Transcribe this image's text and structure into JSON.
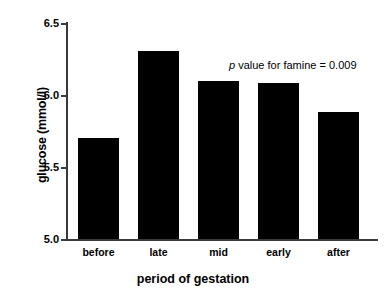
{
  "chart_data": {
    "type": "bar",
    "title": "",
    "xlabel": "period of gestation",
    "ylabel": "glucose (mmol/l)",
    "categories": [
      "before",
      "late",
      "mid",
      "early",
      "after"
    ],
    "values": [
      5.7,
      6.3,
      6.09,
      6.08,
      5.88
    ],
    "ylim": [
      5.0,
      6.5
    ],
    "yticks": [
      "5.0",
      "5.5",
      "6.0",
      "6.5"
    ],
    "ytick_values": [
      5.0,
      5.5,
      6.0,
      6.5
    ],
    "grid": false,
    "legend": null,
    "bar_color": "#000000",
    "axis_color": "#3a3a3a",
    "background": "#ffffff",
    "annotations": [
      {
        "text_italic": "p",
        "text_rest": " value for famine = 0.009",
        "full_text": "p value for famine = 0.009"
      }
    ]
  }
}
